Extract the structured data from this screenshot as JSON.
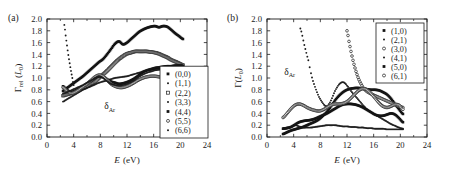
{
  "figure": {
    "panels": [
      {
        "tag": "(a)",
        "annotation": "δ",
        "annotation_sub": "Ar",
        "xlabel_sym": "E",
        "xlabel_unit": "(eV)",
        "ylabel_sym": "Γ",
        "ylabel_sub": "rel",
        "ylabel_unit_open": " (",
        "ylabel_unit_sym": "L",
        "ylabel_unit_sub": "0",
        "ylabel_unit_close": ")",
        "xticks": [
          "0",
          "4",
          "8",
          "12",
          "16",
          "20",
          "24"
        ],
        "yticks": [
          "0.0",
          "0.2",
          "0.4",
          "0.6",
          "0.8",
          "1.0",
          "1.2",
          "1.4",
          "1.6",
          "1.8",
          "2.0"
        ],
        "legend": [
          {
            "label": "(0,0)",
            "marker": "square-filled"
          },
          {
            "label": "(1,1)",
            "marker": "dot-small"
          },
          {
            "label": "(2,2)",
            "marker": "square-open"
          },
          {
            "label": "(3,3)",
            "marker": "dot-small"
          },
          {
            "label": "(4,4)",
            "marker": "square-filled"
          },
          {
            "label": "(5,5)",
            "marker": "circle-open"
          },
          {
            "label": "(6,6)",
            "marker": "dot-small"
          }
        ]
      },
      {
        "tag": "(b)",
        "annotation": "δ",
        "annotation_sub": "Ar",
        "xlabel_sym": "E",
        "xlabel_unit": "(eV)",
        "ylabel_sym": "Γ",
        "ylabel_sub": "",
        "ylabel_unit_open": "(",
        "ylabel_unit_sym": "L",
        "ylabel_unit_sub": "0",
        "ylabel_unit_close": ")",
        "xticks": [
          "0",
          "4",
          "8",
          "12",
          "16",
          "20",
          "24"
        ],
        "yticks": [
          "0.0",
          "0.2",
          "0.4",
          "0.6",
          "0.8",
          "1.0",
          "1.2",
          "1.4",
          "1.6",
          "1.8",
          "2.0"
        ],
        "legend": [
          {
            "label": "(1,0)",
            "marker": "square-filled"
          },
          {
            "label": "(2,1)",
            "marker": "dot-small"
          },
          {
            "label": "(3,0)",
            "marker": "circle-open"
          },
          {
            "label": "(4,1)",
            "marker": "dot-small"
          },
          {
            "label": "(5,0)",
            "marker": "square-filled"
          },
          {
            "label": "(6,1)",
            "marker": "circle-open"
          }
        ]
      }
    ]
  },
  "chart_data": [
    {
      "type": "scatter",
      "panel": "(a)",
      "title": "",
      "xlabel": "E (eV)",
      "ylabel": "Γ_rel (L_0)",
      "xlim": [
        0,
        24
      ],
      "ylim": [
        0.0,
        2.0
      ],
      "xticks": [
        0,
        4,
        8,
        12,
        16,
        20,
        24
      ],
      "yticks": [
        0.0,
        0.2,
        0.4,
        0.6,
        0.8,
        1.0,
        1.2,
        1.4,
        1.6,
        1.8,
        2.0
      ],
      "grid": false,
      "legend_position": "lower-right",
      "annotations": [
        {
          "text": "δ_Ar",
          "x": 9.4,
          "y": 0.47
        }
      ],
      "series": [
        {
          "name": "(0,0)",
          "marker": "square-filled",
          "x": [
            2.4,
            3.0,
            3.6,
            4.2,
            4.8,
            5.4,
            6.0,
            6.6,
            7.2,
            7.8,
            8.4,
            9.0,
            9.6,
            10.2,
            10.8,
            11.4,
            12.0,
            12.6,
            13.2,
            13.8,
            14.4,
            15.0,
            15.6,
            16.2,
            16.8,
            17.4,
            18.0,
            18.6,
            19.2,
            19.8,
            20.4
          ],
          "y": [
            0.78,
            0.83,
            0.88,
            0.93,
            0.98,
            1.03,
            1.09,
            1.15,
            1.21,
            1.27,
            1.32,
            1.4,
            1.49,
            1.58,
            1.62,
            1.57,
            1.6,
            1.66,
            1.72,
            1.78,
            1.82,
            1.85,
            1.87,
            1.88,
            1.86,
            1.88,
            1.87,
            1.82,
            1.76,
            1.71,
            1.66
          ]
        },
        {
          "name": "(1,1)",
          "marker": "dot-small",
          "x": [
            2.6,
            2.8,
            3.0,
            3.2,
            3.4,
            3.6,
            3.8,
            4.0
          ],
          "y": [
            1.9,
            1.72,
            1.55,
            1.39,
            1.25,
            1.12,
            1.0,
            0.88
          ]
        },
        {
          "name": "(2,2)",
          "marker": "square-open",
          "x": [
            2.4,
            3.0,
            3.6,
            4.2,
            4.8,
            5.4,
            6.0,
            6.6,
            7.2,
            7.8,
            8.4,
            9.0,
            9.6,
            10.2,
            10.8,
            11.4,
            12.0,
            12.6,
            13.2,
            13.8,
            14.4,
            15.0,
            15.6,
            16.2,
            16.8,
            17.4,
            18.0,
            18.6,
            19.2,
            19.8,
            20.4
          ],
          "y": [
            0.7,
            0.72,
            0.74,
            0.77,
            0.8,
            0.83,
            0.86,
            0.9,
            0.94,
            1.0,
            1.06,
            1.12,
            1.19,
            1.26,
            1.32,
            1.37,
            1.41,
            1.43,
            1.45,
            1.45,
            1.45,
            1.45,
            1.44,
            1.43,
            1.41,
            1.38,
            1.35,
            1.31,
            1.28,
            1.25,
            1.22
          ]
        },
        {
          "name": "(3,3)",
          "marker": "dot-small",
          "x": [
            2.4,
            3.0,
            3.6,
            4.2,
            4.8,
            5.4,
            6.0,
            6.6,
            7.2,
            7.8,
            8.4,
            9.0,
            9.6,
            10.2,
            10.8,
            11.4,
            12.0,
            12.6,
            13.2,
            13.8,
            14.4,
            15.0,
            15.6,
            16.2,
            16.8,
            17.4,
            18.0,
            18.6,
            19.2,
            19.8,
            20.4
          ],
          "y": [
            0.6,
            0.64,
            0.68,
            0.72,
            0.76,
            0.8,
            0.83,
            0.86,
            0.89,
            0.92,
            0.94,
            0.96,
            0.98,
            1.0,
            1.01,
            1.02,
            1.03,
            1.05,
            1.07,
            1.09,
            1.11,
            1.13,
            1.14,
            1.15,
            1.16,
            1.17,
            1.18,
            1.19,
            1.19,
            1.2,
            1.2
          ]
        },
        {
          "name": "(4,4)",
          "marker": "square-filled",
          "x": [
            2.4,
            3.0,
            3.6,
            4.2,
            4.8,
            5.4,
            6.0,
            6.6,
            7.2,
            7.8,
            8.4,
            9.0,
            9.6,
            10.2,
            10.8,
            11.4,
            12.0,
            12.6,
            13.2,
            13.8,
            14.4,
            15.0,
            15.6,
            16.2,
            16.8,
            17.4,
            18.0,
            18.6,
            19.2,
            19.8,
            20.4
          ],
          "y": [
            0.86,
            0.8,
            0.76,
            0.78,
            0.82,
            0.86,
            0.9,
            0.95,
            1.0,
            1.03,
            1.02,
            0.98,
            0.94,
            0.92,
            0.9,
            0.91,
            0.93,
            0.96,
            1.0,
            1.05,
            1.1,
            1.13,
            1.15,
            1.17,
            1.18,
            1.19,
            1.2,
            1.2,
            1.21,
            1.21,
            1.21
          ]
        },
        {
          "name": "(5,5)",
          "marker": "circle-open",
          "x": [
            2.4,
            3.0,
            3.6,
            4.2,
            4.8,
            5.4,
            6.0,
            6.6,
            7.2,
            7.8,
            8.4,
            9.0,
            9.6,
            10.2,
            10.8,
            11.4,
            12.0,
            12.6,
            13.2,
            13.8,
            14.4,
            15.0,
            15.6,
            16.2,
            16.8,
            17.4,
            18.0,
            18.6,
            19.2,
            19.8,
            20.4
          ],
          "y": [
            0.84,
            0.78,
            0.74,
            0.76,
            0.8,
            0.85,
            0.9,
            0.96,
            1.02,
            1.05,
            1.03,
            0.97,
            0.9,
            0.86,
            0.84,
            0.84,
            0.86,
            0.89,
            0.93,
            0.97,
            1.0,
            1.02,
            1.03,
            1.03,
            1.02,
            1.01,
            0.99,
            0.98,
            0.97,
            0.96,
            0.95
          ]
        },
        {
          "name": "(6,6)",
          "marker": "dot-small",
          "x": [
            2.4,
            3.0,
            3.6,
            4.2,
            4.8,
            5.4,
            6.0,
            6.6,
            7.2,
            7.8,
            8.4,
            9.0,
            9.6,
            10.2,
            10.8,
            11.4,
            12.0,
            12.6,
            13.2,
            13.8,
            14.4,
            15.0,
            15.6,
            16.2,
            16.8,
            17.4,
            18.0,
            18.6,
            19.2,
            19.8,
            20.4
          ],
          "y": [
            0.74,
            0.76,
            0.79,
            0.82,
            0.85,
            0.88,
            0.92,
            0.96,
            1.0,
            1.03,
            1.0,
            0.95,
            0.9,
            0.88,
            0.87,
            0.88,
            0.9,
            0.93,
            0.97,
            1.02,
            1.06,
            1.09,
            1.11,
            1.13,
            1.14,
            1.15,
            1.16,
            1.17,
            1.18,
            1.19,
            1.2
          ]
        }
      ]
    },
    {
      "type": "scatter",
      "panel": "(b)",
      "title": "",
      "xlabel": "E (eV)",
      "ylabel": "Γ(L_0)",
      "xlim": [
        0,
        24
      ],
      "ylim": [
        0.0,
        2.0
      ],
      "xticks": [
        0,
        4,
        8,
        12,
        16,
        20,
        24
      ],
      "yticks": [
        0.0,
        0.2,
        0.4,
        0.6,
        0.8,
        1.0,
        1.2,
        1.4,
        1.6,
        1.8,
        2.0
      ],
      "grid": false,
      "legend_position": "upper-right",
      "annotations": [
        {
          "text": "δ_Ar",
          "x": 3.4,
          "y": 1.05
        }
      ],
      "series": [
        {
          "name": "(1,0)",
          "marker": "square-filled",
          "x": [
            2.4,
            3.0,
            3.6,
            4.2,
            4.8,
            5.4,
            6.0,
            6.6,
            7.2,
            7.8,
            8.4,
            9.0,
            9.6,
            10.2,
            10.8,
            11.4,
            12.0,
            12.6,
            13.2,
            13.8,
            14.4,
            15.0,
            15.6,
            16.2,
            16.8,
            17.4,
            18.0,
            18.6,
            19.2,
            19.8,
            20.4
          ],
          "y": [
            0.05,
            0.08,
            0.11,
            0.13,
            0.15,
            0.17,
            0.2,
            0.23,
            0.26,
            0.3,
            0.36,
            0.43,
            0.52,
            0.62,
            0.7,
            0.76,
            0.8,
            0.82,
            0.83,
            0.83,
            0.82,
            0.81,
            0.8,
            0.8,
            0.79,
            0.76,
            0.72,
            0.65,
            0.56,
            0.47,
            0.39
          ]
        },
        {
          "name": "(2,1)",
          "marker": "dot-small",
          "x": [
            5.0,
            5.6,
            6.2,
            6.6,
            6.9,
            7.2,
            7.5,
            7.8,
            8.1,
            8.4,
            8.7,
            9.0,
            9.3,
            9.6,
            9.9,
            10.2,
            10.5,
            10.8,
            11.1,
            11.4,
            11.7,
            12.0,
            12.6,
            13.2,
            13.8,
            14.4,
            15.0,
            15.6,
            16.2,
            16.8,
            17.4,
            18.0,
            18.6,
            19.2,
            19.8,
            20.4
          ],
          "y": [
            1.84,
            1.56,
            1.3,
            1.08,
            0.95,
            0.85,
            0.76,
            0.68,
            0.62,
            0.57,
            0.53,
            0.52,
            0.56,
            0.62,
            0.7,
            0.78,
            0.84,
            0.89,
            0.92,
            0.93,
            0.91,
            0.87,
            0.78,
            0.7,
            0.62,
            0.54,
            0.47,
            0.42,
            0.38,
            0.34,
            0.3,
            0.26,
            0.22,
            0.19,
            0.16,
            0.14
          ]
        },
        {
          "name": "(3,0)",
          "marker": "circle-open",
          "x": [
            12.0,
            12.3,
            12.6,
            12.9,
            13.2,
            13.5,
            13.8,
            14.1,
            14.4,
            14.7,
            15.0,
            15.6,
            16.2,
            16.8,
            17.4,
            18.0,
            18.6,
            19.2,
            19.8,
            20.4
          ],
          "y": [
            1.8,
            1.62,
            1.45,
            1.3,
            1.17,
            1.06,
            0.97,
            0.9,
            0.84,
            0.8,
            0.77,
            0.73,
            0.7,
            0.67,
            0.64,
            0.61,
            0.58,
            0.55,
            0.52,
            0.5
          ]
        },
        {
          "name": "(4,1)",
          "marker": "dot-small",
          "x": [
            2.4,
            3.0,
            3.6,
            4.2,
            4.8,
            5.4,
            6.0,
            6.6,
            7.2,
            7.8,
            8.4,
            9.0,
            9.6,
            10.2,
            10.8,
            11.4,
            12.0,
            12.6,
            13.2,
            13.8,
            14.4,
            15.0,
            15.6,
            16.2,
            16.8,
            17.4,
            18.0,
            18.6,
            19.2,
            19.8,
            20.4
          ],
          "y": [
            0.15,
            0.16,
            0.17,
            0.2,
            0.18,
            0.16,
            0.16,
            0.16,
            0.17,
            0.18,
            0.19,
            0.2,
            0.2,
            0.2,
            0.19,
            0.18,
            0.18,
            0.17,
            0.17,
            0.16,
            0.16,
            0.15,
            0.15,
            0.14,
            0.14,
            0.14,
            0.13,
            0.13,
            0.13,
            0.13,
            0.13
          ]
        },
        {
          "name": "(5,0)",
          "marker": "square-filled",
          "x": [
            2.4,
            3.0,
            3.6,
            4.2,
            4.8,
            5.4,
            6.0,
            6.6,
            7.2,
            7.8,
            8.4,
            9.0,
            9.6,
            10.2,
            10.8,
            11.4,
            12.0,
            12.6,
            13.2,
            13.8,
            14.4,
            15.0,
            15.6,
            16.2,
            16.8,
            17.4,
            18.0,
            18.6,
            19.2,
            19.8,
            20.4
          ],
          "y": [
            0.14,
            0.15,
            0.17,
            0.21,
            0.25,
            0.27,
            0.28,
            0.29,
            0.31,
            0.34,
            0.37,
            0.4,
            0.44,
            0.48,
            0.52,
            0.55,
            0.56,
            0.56,
            0.55,
            0.53,
            0.5,
            0.46,
            0.42,
            0.38,
            0.36,
            0.36,
            0.38,
            0.4,
            0.38,
            0.32,
            0.25
          ]
        },
        {
          "name": "(6,1)",
          "marker": "circle-open",
          "x": [
            2.4,
            3.0,
            3.6,
            4.2,
            4.8,
            5.4,
            6.0,
            6.6,
            7.2,
            7.8,
            8.4,
            9.0,
            9.6,
            10.2,
            10.8,
            11.4,
            12.0,
            12.6,
            13.2,
            13.8,
            14.4,
            15.0,
            15.6,
            16.2,
            16.8,
            17.4,
            18.0,
            18.6,
            19.2,
            19.8,
            20.4
          ],
          "y": [
            0.33,
            0.4,
            0.48,
            0.54,
            0.56,
            0.54,
            0.5,
            0.47,
            0.45,
            0.44,
            0.46,
            0.5,
            0.54,
            0.56,
            0.56,
            0.57,
            0.6,
            0.66,
            0.73,
            0.79,
            0.82,
            0.8,
            0.74,
            0.66,
            0.58,
            0.52,
            0.5,
            0.52,
            0.55,
            0.54,
            0.47
          ]
        }
      ]
    }
  ]
}
